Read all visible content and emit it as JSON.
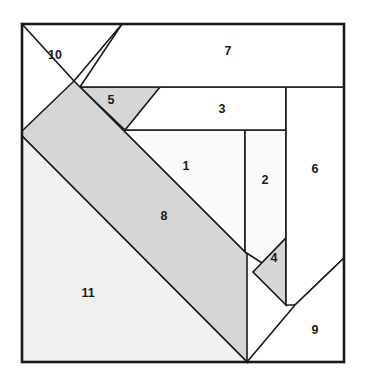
{
  "figure": {
    "canvas": {
      "width": 365,
      "height": 381
    },
    "frame": {
      "x": 22,
      "y": 24,
      "width": 322,
      "height": 338
    },
    "colors": {
      "background": "#ffffff",
      "outline": "#1a1a1a",
      "fill_white": "#ffffff",
      "fill_band": "#d6d6d6",
      "fill_pale": "#f1f1f1",
      "fill_offwhite": "#fafafa",
      "label_text": "#1a1a1a"
    },
    "regions": [
      {
        "id": "1",
        "label": "1",
        "fill_key": "fill_offwhite",
        "points": "125,130 245,130 245,252 124,131",
        "label_x": 186,
        "label_y": 167
      },
      {
        "id": "2",
        "label": "2",
        "fill_key": "fill_offwhite",
        "points": "245,130 286,130 286,238 262,263 245,252",
        "label_x": 265,
        "label_y": 181
      },
      {
        "id": "3",
        "label": "3",
        "fill_key": "fill_white",
        "points": "80,87 286,87 286,130 125,130",
        "label_x": 222,
        "label_y": 110
      },
      {
        "id": "4",
        "label": "4",
        "fill_key": "fill_band",
        "points": "286,238 286,305 253,272",
        "label_x": 274,
        "label_y": 259
      },
      {
        "id": "5",
        "label": "5",
        "fill_key": "fill_band",
        "points": "80,87 160,87 125,130",
        "label_x": 111,
        "label_y": 101
      },
      {
        "id": "6",
        "label": "6",
        "fill_key": "fill_white",
        "points": "286,87 344,87 344,258 295,305 286,305",
        "label_x": 315,
        "label_y": 170
      },
      {
        "id": "7",
        "label": "7",
        "fill_key": "fill_white",
        "points": "122,24 344,24 344,87 80,87",
        "label_x": 228,
        "label_y": 52
      },
      {
        "id": "8",
        "label": "8",
        "fill_key": "fill_band",
        "points": "74,81 247,254 247,362 22,136 22,131",
        "label_x": 164,
        "label_y": 217
      },
      {
        "id": "9",
        "label": "9",
        "fill_key": "fill_white",
        "points": "344,258 344,362 247,362 295,305",
        "label_x": 315,
        "label_y": 331
      },
      {
        "id": "10",
        "label": "10",
        "fill_key": "fill_white",
        "points": "22,24 122,24 74,81",
        "label_x": 55,
        "label_y": 56
      },
      {
        "id": "11",
        "label": "11",
        "fill_key": "fill_pale",
        "points": "22,136 247,362 22,362",
        "label_x": 88,
        "label_y": 294
      }
    ]
  }
}
